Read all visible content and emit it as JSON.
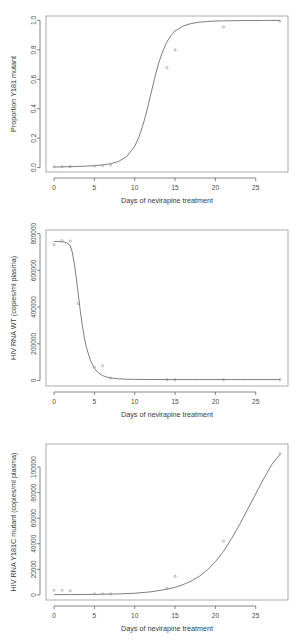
{
  "figure": {
    "panel_count": 3,
    "style": "r-base-graphics",
    "line_color": "#6f6f6f",
    "point_color": "#8d8d8d",
    "axis_color": "#555555",
    "background": "#ffffff"
  },
  "chart_data": [
    {
      "id": "panel-1",
      "type": "line",
      "title": "",
      "xlabel": "Days of nevirapine treatment",
      "ylabel": "Proportion Y181 mutant",
      "xlim": [
        -1,
        29
      ],
      "ylim": [
        -0.03,
        1.03
      ],
      "xticks": [
        0,
        5,
        10,
        15,
        20,
        25
      ],
      "xticklabels": [
        "0",
        "5",
        "10",
        "15",
        "20",
        "25"
      ],
      "yticks": [
        0.0,
        0.2,
        0.4,
        0.6,
        0.8,
        1.0
      ],
      "yticklabels": [
        "0.0",
        "0.2",
        "0.4",
        "0.6",
        "0.8",
        "1.0"
      ],
      "grid": false,
      "legend": "none",
      "series": [
        {
          "name": "fitted logistic curve",
          "kind": "line",
          "x": [
            0,
            1,
            2,
            3,
            4,
            5,
            6,
            7,
            8,
            9,
            10,
            10.5,
            11,
            11.5,
            12,
            12.5,
            13,
            13.5,
            14,
            14.5,
            15,
            16,
            17,
            18,
            19,
            20,
            21,
            22,
            23,
            24,
            25,
            26,
            27,
            28
          ],
          "y": [
            0.004,
            0.005,
            0.006,
            0.008,
            0.01,
            0.013,
            0.018,
            0.026,
            0.042,
            0.075,
            0.145,
            0.205,
            0.285,
            0.385,
            0.5,
            0.615,
            0.715,
            0.795,
            0.855,
            0.898,
            0.928,
            0.962,
            0.979,
            0.988,
            0.993,
            0.996,
            0.997,
            0.998,
            0.999,
            0.999,
            0.999,
            1.0,
            1.0,
            1.0
          ]
        },
        {
          "name": "observed proportion",
          "kind": "scatter",
          "x": [
            0,
            1,
            2,
            5,
            6,
            7,
            14,
            15,
            21,
            28
          ],
          "y": [
            0.005,
            0.006,
            0.007,
            0.01,
            0.013,
            0.016,
            0.68,
            0.8,
            0.955,
            0.995
          ]
        }
      ]
    },
    {
      "id": "panel-2",
      "type": "line",
      "title": "",
      "xlabel": "Days of nevirapine treatment",
      "ylabel": "HIV RNA WT (copies/ml plasma)",
      "xlim": [
        -1,
        29
      ],
      "ylim": [
        -30000,
        820000
      ],
      "xticks": [
        0,
        5,
        10,
        15,
        20,
        25
      ],
      "xticklabels": [
        "0",
        "5",
        "10",
        "15",
        "20",
        "25"
      ],
      "yticks": [
        0,
        200000,
        400000,
        600000,
        800000
      ],
      "yticklabels": [
        "0",
        "200000",
        "400000",
        "600000",
        "800000"
      ],
      "grid": false,
      "legend": "none",
      "series": [
        {
          "name": "fitted decay curve",
          "kind": "line",
          "x": [
            0,
            0.5,
            1,
            1.5,
            2,
            2.25,
            2.5,
            2.75,
            3,
            3.25,
            3.5,
            3.75,
            4,
            4.5,
            5,
            5.5,
            6,
            6.5,
            7,
            8,
            9,
            10,
            12,
            14,
            16,
            18,
            20,
            22,
            24,
            26,
            28
          ],
          "y": [
            757000,
            757000,
            756000,
            752000,
            735000,
            700000,
            640000,
            560000,
            470000,
            380000,
            300000,
            235000,
            182000,
            110000,
            66000,
            41000,
            27000,
            19000,
            14000,
            9000,
            7000,
            6000,
            5200,
            5000,
            5000,
            5000,
            5000,
            5000,
            5000,
            5000,
            5000
          ]
        },
        {
          "name": "observed WT RNA",
          "kind": "scatter",
          "x": [
            0,
            1,
            2,
            3,
            5,
            6,
            7,
            14,
            15,
            21,
            28
          ],
          "y": [
            740000,
            762000,
            760000,
            420000,
            72000,
            80000,
            13000,
            5000,
            5000,
            5000,
            5000
          ]
        }
      ]
    },
    {
      "id": "panel-3",
      "type": "line",
      "title": "",
      "xlabel": "Days of nevirapine treatment",
      "ylabel": "HIV RNA Y181C mutant (copies/ml plasma)",
      "xlim": [
        -1,
        29
      ],
      "ylim": [
        -4000,
        118000
      ],
      "xticks": [
        0,
        5,
        10,
        15,
        20,
        25
      ],
      "xticklabels": [
        "0",
        "5",
        "10",
        "15",
        "20",
        "25"
      ],
      "yticks": [
        0,
        20000,
        40000,
        60000,
        80000,
        100000
      ],
      "yticklabels": [
        "0",
        "20000",
        "40000",
        "60000",
        "80000",
        "100000"
      ],
      "grid": false,
      "legend": "none",
      "series": [
        {
          "name": "fitted growth curve",
          "kind": "line",
          "x": [
            0,
            2,
            4,
            6,
            8,
            10,
            12,
            14,
            15,
            16,
            17,
            18,
            19,
            20,
            21,
            22,
            23,
            24,
            25,
            26,
            27,
            28
          ],
          "y": [
            200,
            250,
            330,
            470,
            750,
            1300,
            2400,
            4400,
            5900,
            8000,
            10800,
            14500,
            19500,
            26000,
            34000,
            44000,
            55000,
            67000,
            79000,
            91000,
            102000,
            110000
          ]
        },
        {
          "name": "observed mutant RNA",
          "kind": "scatter",
          "x": [
            0,
            1,
            2,
            5,
            6,
            7,
            14,
            15,
            21,
            28
          ],
          "y": [
            3500,
            3500,
            3200,
            900,
            800,
            700,
            5200,
            14500,
            42000,
            110500
          ]
        }
      ]
    }
  ]
}
